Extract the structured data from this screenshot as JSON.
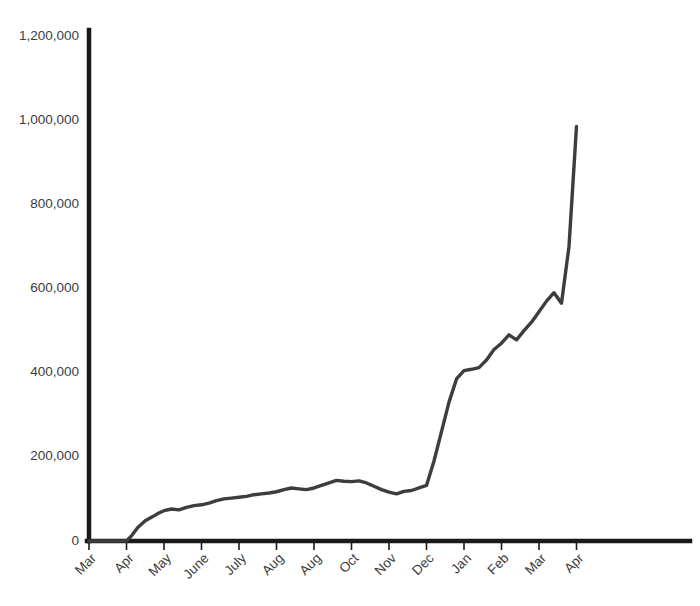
{
  "chart_data": {
    "type": "line",
    "title": "",
    "subtitle": "",
    "xlabel": "",
    "ylabel": "",
    "grid": false,
    "legend": null,
    "line_color": "#3d3d3d",
    "axis_color": "#1a1a1a",
    "background_color": "#ffffff",
    "ylim": [
      0,
      1200000
    ],
    "ytick_values": [
      0,
      200000,
      400000,
      600000,
      800000,
      1000000,
      1200000
    ],
    "ytick_labels": [
      "0",
      "200,000",
      "400,000",
      "600,000",
      "800,000",
      "1,000,000",
      "1,200,000"
    ],
    "xtick_labels": [
      "Mar",
      "Apr",
      "May",
      "June",
      "July",
      "Aug",
      "Aug",
      "Oct",
      "Nov",
      "Dec",
      "Jan",
      "Feb",
      "Mar",
      "Apr"
    ],
    "xtick_label_rotation": -45,
    "x": [
      0,
      0.2,
      0.4,
      0.6,
      0.8,
      1,
      1.15,
      1.3,
      1.5,
      1.7,
      1.85,
      2,
      2.2,
      2.4,
      2.6,
      2.8,
      3,
      3.2,
      3.4,
      3.6,
      3.8,
      4,
      4.2,
      4.4,
      4.6,
      4.8,
      5,
      5.2,
      5.4,
      5.6,
      5.8,
      6,
      6.2,
      6.4,
      6.6,
      6.8,
      7,
      7.2,
      7.4,
      7.6,
      7.8,
      8,
      8.2,
      8.4,
      8.6,
      8.8,
      9,
      9.2,
      9.4,
      9.6,
      9.8,
      10,
      10.2,
      10.4,
      10.6,
      10.8,
      11,
      11.2,
      11.4,
      11.6,
      11.8,
      12,
      12.2,
      12.4,
      12.6,
      12.8,
      13
    ],
    "values": [
      0,
      0,
      0,
      0,
      0,
      0,
      14000,
      32000,
      48000,
      58000,
      66000,
      72000,
      76000,
      74000,
      80000,
      84000,
      86000,
      90000,
      96000,
      100000,
      102000,
      104000,
      106000,
      110000,
      112000,
      114000,
      117000,
      122000,
      126000,
      124000,
      122000,
      126000,
      132000,
      138000,
      144000,
      142000,
      141000,
      143000,
      138000,
      130000,
      122000,
      116000,
      112000,
      118000,
      120000,
      126000,
      132000,
      190000,
      260000,
      330000,
      385000,
      405000,
      408000,
      412000,
      430000,
      455000,
      470000,
      490000,
      478000,
      500000,
      520000,
      545000,
      570000,
      590000,
      565000,
      700000,
      985000
    ],
    "series_name": "",
    "annotations": []
  },
  "axes": {
    "x_axis_name": "x-axis",
    "y_axis_name": "y-axis"
  }
}
